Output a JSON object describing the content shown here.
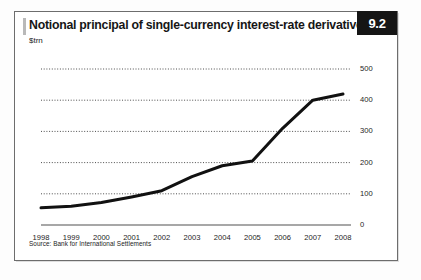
{
  "figure": {
    "badge_number": "9.2",
    "title": "Notional principal of single-currency interest-rate derivatives",
    "subtitle": "$trn",
    "source": "Source: Bank for International Settlements"
  },
  "chart_data": {
    "type": "line",
    "title": "Notional principal of single-currency interest-rate derivatives",
    "subtitle": "$trn",
    "xlabel": "",
    "ylabel": "$trn",
    "categories": [
      "1998",
      "1999",
      "2000",
      "2001",
      "2002",
      "2003",
      "2004",
      "2005",
      "2006",
      "2007",
      "2008"
    ],
    "values": [
      55,
      60,
      72,
      90,
      110,
      155,
      190,
      205,
      310,
      400,
      420
    ],
    "ylim": [
      0,
      500
    ],
    "yticks": [
      0,
      100,
      200,
      300,
      400,
      500
    ],
    "ytick_labels": [
      "0",
      "100",
      "200",
      "300",
      "400",
      "500"
    ],
    "xtick_labels": [
      "1998",
      "1999",
      "2000",
      "2001",
      "2002",
      "2003",
      "2004",
      "2005",
      "2006",
      "2007",
      "2008"
    ],
    "grid": "horizontal-dotted",
    "legend": "none",
    "line_color": "#111111",
    "line_width": 3,
    "axis_position": "right",
    "series": [
      {
        "name": "Notional principal",
        "values": [
          55,
          60,
          72,
          90,
          110,
          155,
          190,
          205,
          310,
          400,
          420
        ]
      }
    ]
  },
  "colors": {
    "badge_bg": "#151515",
    "badge_text": "#ffffff",
    "frame_border": "#6d6d6d",
    "grid": "#555555",
    "axis": "#8a8a8a",
    "line": "#111111"
  }
}
